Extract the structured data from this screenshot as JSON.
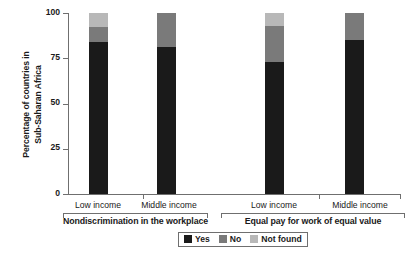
{
  "chart_data": {
    "type": "bar",
    "subtype": "stacked-bar",
    "title": "",
    "xlabel": "",
    "ylabel": "Percentage of countries in Sub-Saharan Africa",
    "ylabel_lines": [
      "Percentage of countries in",
      "Sub-Saharan Africa"
    ],
    "ylim": [
      0,
      100
    ],
    "yticks": [
      0,
      25,
      50,
      75,
      100
    ],
    "ytick_labels": [
      "0",
      "25",
      "50",
      "75",
      "100"
    ],
    "grid": false,
    "legend_position": "bottom",
    "stacked": true,
    "stack_total": 100,
    "units": "percent",
    "categories": [
      "Low income",
      "Middle income",
      "Low income",
      "Middle income"
    ],
    "groups": [
      {
        "label": "Nondiscrimination in the workplace",
        "categories": [
          "Low income",
          "Middle income"
        ]
      },
      {
        "label": "Equal pay for work of equal value",
        "categories": [
          "Low income",
          "Middle income"
        ]
      }
    ],
    "series": [
      {
        "name": "Yes",
        "color": "#1a1a1a",
        "values": [
          84,
          81,
          73,
          85
        ]
      },
      {
        "name": "No",
        "color": "#7a7a7a",
        "values": [
          8,
          19,
          20,
          15
        ]
      },
      {
        "name": "Not found",
        "color": "#b8b8b8",
        "values": [
          8,
          0,
          7,
          0
        ]
      }
    ],
    "legend": [
      {
        "label": "Yes",
        "color": "#1a1a1a"
      },
      {
        "label": "No",
        "color": "#7a7a7a"
      },
      {
        "label": "Not found",
        "color": "#b8b8b8"
      }
    ]
  },
  "colors": {
    "yes": "#1a1a1a",
    "no": "#7a7a7a",
    "not_found": "#b8b8b8",
    "axis": "#6f6f6f",
    "background": "#ffffff"
  }
}
